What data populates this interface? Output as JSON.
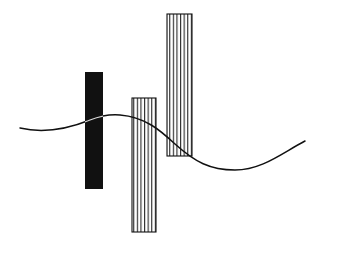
{
  "figure": {
    "background": "#ffffff",
    "ink": "#111111",
    "shapes": [
      {
        "id": "solid-bar",
        "kind": "rect",
        "fill": "solid",
        "x": 85,
        "y": 72,
        "width": 18,
        "height": 117
      },
      {
        "id": "hatched-bar-middle",
        "kind": "rect",
        "fill": "vertical-hatch",
        "x": 132,
        "y": 98,
        "width": 24,
        "height": 134,
        "hatch_lines": 7
      },
      {
        "id": "hatched-bar-tall",
        "kind": "rect",
        "fill": "vertical-hatch",
        "x": 167,
        "y": 14,
        "width": 25,
        "height": 142,
        "hatch_lines": 8
      }
    ],
    "curve": {
      "id": "wave-curve",
      "kind": "sine-like",
      "start": [
        20,
        128
      ],
      "peak": [
        110,
        114
      ],
      "trough": [
        235,
        170
      ],
      "end": [
        305,
        141
      ]
    }
  }
}
